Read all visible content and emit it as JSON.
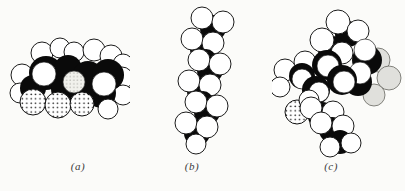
{
  "figure": {
    "panels": [
      {
        "id": "a",
        "label": "(a)",
        "model": "compact horizontal molecule with three stippled oxygen spheres at bottom"
      },
      {
        "id": "b",
        "label": "(b)",
        "model": "extended vertical zigzag hydrocarbon chain"
      },
      {
        "id": "c",
        "label": "(c)",
        "model": "large branched cluster with one stippled oxygen sphere and shaded spheres"
      }
    ],
    "colors": {
      "background": "#fbfbf9",
      "carbon_sphere": "#0a0a0a",
      "hydrogen_sphere": "#ffffff",
      "oxygen_stipple_dots": "#111111",
      "shaded_sphere": "#e0e0dc",
      "label_text": "#3a3a3a"
    }
  }
}
